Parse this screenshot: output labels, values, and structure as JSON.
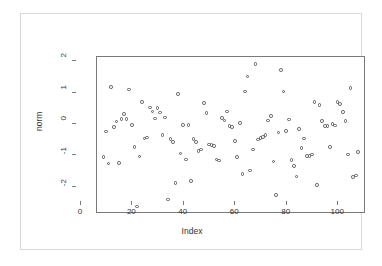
{
  "figure": {
    "background_color": "#ffffff",
    "frame_color": "#d9d9d9",
    "axis_color": "#7a7a7a",
    "point_color": "#595959"
  },
  "chart_data": {
    "type": "scatter",
    "title": "",
    "xlabel": "Index",
    "ylabel": "norm",
    "xlim": [
      -1.5,
      103
    ],
    "ylim": [
      -2.45,
      2.55
    ],
    "xticks": [
      0,
      20,
      40,
      60,
      80,
      100
    ],
    "yticks": [
      -2,
      -1,
      0,
      1,
      2
    ],
    "xticklabels": [
      "0",
      "20",
      "40",
      "60",
      "80",
      "100"
    ],
    "yticklabels": [
      "-2",
      "-1",
      "0",
      "1",
      "2"
    ],
    "grid": false,
    "legend": null,
    "marker": "open-circle",
    "n_points": 100,
    "series": [
      {
        "name": "norm",
        "x": [
          1,
          2,
          3,
          4,
          5,
          6,
          7,
          8,
          9,
          10,
          11,
          12,
          13,
          14,
          15,
          16,
          17,
          18,
          19,
          20,
          21,
          22,
          23,
          24,
          25,
          26,
          27,
          28,
          29,
          30,
          31,
          32,
          33,
          34,
          35,
          36,
          37,
          38,
          39,
          40,
          41,
          42,
          43,
          44,
          45,
          46,
          47,
          48,
          49,
          50,
          51,
          52,
          53,
          54,
          55,
          56,
          57,
          58,
          59,
          60,
          61,
          62,
          63,
          64,
          65,
          66,
          67,
          68,
          69,
          70,
          71,
          72,
          73,
          74,
          75,
          76,
          77,
          78,
          79,
          80,
          81,
          82,
          83,
          84,
          85,
          86,
          87,
          88,
          89,
          90,
          91,
          92,
          93,
          94,
          95,
          96,
          97,
          98,
          99,
          100
        ],
        "y": [
          -0.63,
          0.18,
          -0.84,
          1.6,
          0.33,
          0.49,
          -0.82,
          0.57,
          0.74,
          0.58,
          1.51,
          0.39,
          -0.31,
          -2.21,
          -0.62,
          1.12,
          -0.04,
          -0.02,
          0.94,
          0.82,
          0.59,
          0.92,
          0.78,
          0.07,
          0.62,
          -1.99,
          -0.06,
          -0.16,
          -1.47,
          1.37,
          -0.52,
          0.38,
          -0.71,
          0.38,
          -1.39,
          -0.07,
          -0.16,
          -0.44,
          -0.4,
          1.09,
          0.76,
          -0.24,
          -0.25,
          -0.29,
          -0.72,
          -0.74,
          0.61,
          0.53,
          0.82,
          0.36,
          0.32,
          -0.12,
          -0.63,
          0.45,
          -1.17,
          1.45,
          1.93,
          -1.07,
          -0.4,
          2.33,
          -0.08,
          -0.03,
          0.0,
          0.07,
          0.53,
          0.67,
          -0.78,
          -1.84,
          0.15,
          2.13,
          1.45,
          0.2,
          0.56,
          -0.73,
          -0.93,
          -1.25,
          0.25,
          -0.35,
          -0.04,
          -0.6,
          -0.61,
          -0.55,
          1.12,
          -1.52,
          1.02,
          0.51,
          0.35,
          0.35,
          -0.32,
          0.42,
          0.37,
          1.11,
          1.06,
          0.79,
          0.52,
          -0.55,
          1.56,
          -1.28,
          -1.22,
          -0.47
        ]
      }
    ]
  }
}
